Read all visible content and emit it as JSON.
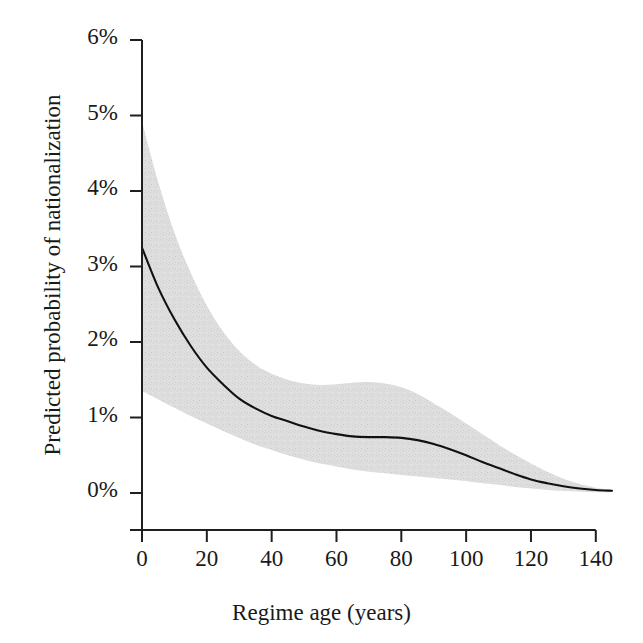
{
  "figure": {
    "background": "#ffffff",
    "cut_off_top_text": "",
    "axis_color": "#1a1a1a",
    "line_color": "#111111",
    "band_color": "#dcdcdc"
  },
  "chart_data": {
    "type": "line",
    "title": "",
    "xlabel": "Regime age (years)",
    "ylabel": "Predicted probability of nationalization",
    "grid": false,
    "legend": null,
    "xlim": [
      0,
      145
    ],
    "ylim": [
      0,
      6
    ],
    "xticks": [
      0,
      20,
      40,
      60,
      80,
      100,
      120,
      140
    ],
    "xticklabels": [
      "0",
      "20",
      "40",
      "60",
      "80",
      "100",
      "120",
      "140"
    ],
    "yticks": [
      0,
      1,
      2,
      3,
      4,
      5,
      6
    ],
    "yticklabels": [
      "0%",
      "1%",
      "2%",
      "3%",
      "4%",
      "5%",
      "6%"
    ],
    "y_unit": "percent",
    "series": [
      {
        "name": "Predicted probability",
        "style": "solid-line",
        "x": [
          0,
          5,
          10,
          15,
          20,
          25,
          30,
          35,
          40,
          45,
          50,
          55,
          60,
          65,
          70,
          75,
          80,
          85,
          90,
          95,
          100,
          105,
          110,
          115,
          120,
          125,
          130,
          135,
          140,
          145
        ],
        "values": [
          3.25,
          2.72,
          2.3,
          1.95,
          1.66,
          1.44,
          1.25,
          1.12,
          1.02,
          0.95,
          0.88,
          0.82,
          0.78,
          0.75,
          0.74,
          0.74,
          0.73,
          0.7,
          0.65,
          0.58,
          0.5,
          0.41,
          0.33,
          0.25,
          0.18,
          0.13,
          0.09,
          0.06,
          0.04,
          0.03
        ]
      }
    ],
    "confidence_band": {
      "name": "Confidence interval",
      "x": [
        0,
        5,
        10,
        15,
        20,
        25,
        30,
        35,
        40,
        45,
        50,
        55,
        60,
        65,
        70,
        75,
        80,
        85,
        90,
        95,
        100,
        105,
        110,
        115,
        120,
        125,
        130,
        135,
        140,
        145
      ],
      "upper": [
        4.92,
        4.12,
        3.45,
        2.92,
        2.48,
        2.14,
        1.88,
        1.7,
        1.58,
        1.5,
        1.45,
        1.43,
        1.44,
        1.46,
        1.47,
        1.45,
        1.4,
        1.31,
        1.19,
        1.06,
        0.92,
        0.78,
        0.64,
        0.51,
        0.39,
        0.28,
        0.19,
        0.12,
        0.07,
        0.04
      ],
      "lower": [
        1.35,
        1.24,
        1.13,
        1.02,
        0.92,
        0.82,
        0.73,
        0.64,
        0.57,
        0.5,
        0.44,
        0.39,
        0.35,
        0.31,
        0.28,
        0.26,
        0.24,
        0.22,
        0.2,
        0.18,
        0.16,
        0.13,
        0.11,
        0.08,
        0.06,
        0.04,
        0.03,
        0.02,
        0.01,
        0.01
      ]
    }
  }
}
